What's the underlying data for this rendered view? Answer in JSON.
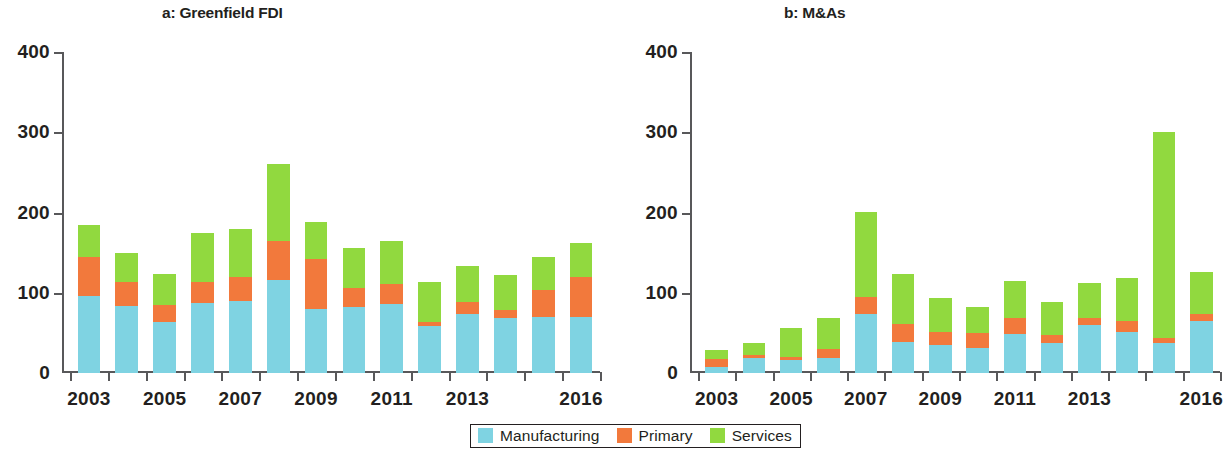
{
  "figure": {
    "legend": {
      "position": "bottom-center",
      "items": [
        {
          "label": "Manufacturing",
          "color": "#7fd3e2",
          "key": "manufacturing"
        },
        {
          "label": "Primary",
          "color": "#f2793c",
          "key": "primary"
        },
        {
          "label": "Services",
          "color": "#91d93f",
          "key": "services"
        }
      ]
    }
  },
  "chart_data": [
    {
      "type": "bar",
      "id": "panel-a",
      "title": "a: Greenfield FDI",
      "xlabel": "",
      "ylabel": "",
      "ylim": [
        0,
        400
      ],
      "yticks": [
        0,
        100,
        200,
        300,
        400
      ],
      "ytick_labels": [
        "0",
        "100",
        "200",
        "300",
        "400"
      ],
      "grid": false,
      "stacked": true,
      "categories": [
        2003,
        2004,
        2005,
        2006,
        2007,
        2008,
        2009,
        2010,
        2011,
        2012,
        2013,
        2014,
        2015,
        2016
      ],
      "xtick_labels": [
        "2003",
        "",
        "2005",
        "",
        "2007",
        "",
        "2009",
        "",
        "2011",
        "",
        "2013",
        "",
        "",
        "2016"
      ],
      "series": [
        {
          "name": "Manufacturing",
          "color": "#7fd3e2",
          "values": [
            96,
            83,
            63,
            87,
            90,
            116,
            80,
            82,
            86,
            59,
            73,
            68,
            70,
            70
          ]
        },
        {
          "name": "Primary",
          "color": "#f2793c",
          "values": [
            48,
            30,
            22,
            27,
            30,
            48,
            62,
            24,
            25,
            4,
            15,
            10,
            33,
            50
          ]
        },
        {
          "name": "Services",
          "color": "#91d93f",
          "values": [
            40,
            37,
            38,
            60,
            60,
            96,
            46,
            50,
            54,
            51,
            45,
            44,
            41,
            42
          ]
        }
      ],
      "totals": [
        184,
        150,
        123,
        174,
        180,
        260,
        188,
        156,
        165,
        114,
        133,
        122,
        144,
        162
      ]
    },
    {
      "type": "bar",
      "id": "panel-b",
      "title": "b: M&As",
      "xlabel": "",
      "ylabel": "",
      "ylim": [
        0,
        400
      ],
      "yticks": [
        0,
        100,
        200,
        300,
        400
      ],
      "ytick_labels": [
        "0",
        "100",
        "200",
        "300",
        "400"
      ],
      "grid": false,
      "stacked": true,
      "categories": [
        2003,
        2004,
        2005,
        2006,
        2007,
        2008,
        2009,
        2010,
        2011,
        2012,
        2013,
        2014,
        2015,
        2016
      ],
      "xtick_labels": [
        "2003",
        "",
        "2005",
        "",
        "2007",
        "",
        "2009",
        "",
        "2011",
        "",
        "2013",
        "",
        "",
        "2016"
      ],
      "series": [
        {
          "name": "Manufacturing",
          "color": "#7fd3e2",
          "values": [
            8,
            19,
            16,
            19,
            74,
            39,
            35,
            31,
            49,
            38,
            60,
            51,
            38,
            65
          ]
        },
        {
          "name": "Primary",
          "color": "#f2793c",
          "values": [
            9,
            3,
            4,
            11,
            21,
            22,
            16,
            19,
            19,
            9,
            8,
            14,
            6,
            8
          ]
        },
        {
          "name": "Services",
          "color": "#91d93f",
          "values": [
            12,
            15,
            36,
            39,
            106,
            62,
            43,
            32,
            47,
            42,
            44,
            53,
            256,
            53
          ]
        }
      ],
      "totals": [
        29,
        37,
        56,
        69,
        201,
        123,
        94,
        82,
        115,
        89,
        112,
        118,
        300,
        126
      ]
    }
  ]
}
